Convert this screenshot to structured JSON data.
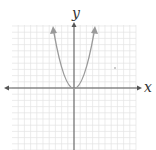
{
  "chart_data": {
    "type": "line",
    "title": "",
    "xlabel": "x",
    "ylabel": "y",
    "grid": true,
    "grid_cells_x": 20,
    "grid_cells_y": 20,
    "xlim": [
      -10,
      10
    ],
    "ylim": [
      -10,
      10
    ],
    "series": [
      {
        "name": "parabola",
        "equation": "y = x^2 (scaled)",
        "vertex": [
          0,
          0
        ],
        "x": [
          -4,
          -3,
          -2,
          -1,
          0,
          1,
          2,
          3,
          4
        ],
        "y": [
          9.5,
          5.3,
          2.4,
          0.6,
          0,
          0.6,
          2.4,
          5.3,
          9.5
        ],
        "arrows_at_ends": true,
        "color": "#999999"
      }
    ],
    "annotations": [
      {
        "type": "dot",
        "x": 8,
        "y": 4
      }
    ]
  },
  "labels": {
    "x_axis": "x",
    "y_axis": "y"
  },
  "colors": {
    "grid": "#e4e4e4",
    "axis": "#555555",
    "curve": "#9a9a9a"
  }
}
